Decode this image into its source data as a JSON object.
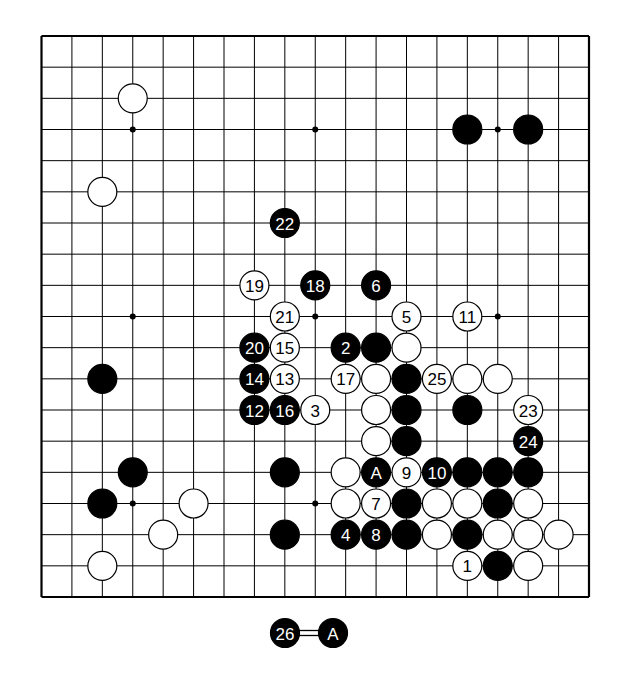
{
  "diagram": {
    "type": "go-board",
    "size": 19,
    "board_colors": {
      "line": "#000000",
      "background": "#ffffff",
      "black_stone": "#000000",
      "white_stone": "#ffffff",
      "black_text": "#ffffff",
      "white_text": "#000000"
    },
    "star_points": [
      [
        3,
        3
      ],
      [
        9,
        3
      ],
      [
        15,
        3
      ],
      [
        3,
        9
      ],
      [
        9,
        9
      ],
      [
        15,
        9
      ],
      [
        3,
        15
      ],
      [
        9,
        15
      ],
      [
        15,
        15
      ]
    ],
    "stones": [
      {
        "col": 3,
        "row": 2,
        "color": "white",
        "label": ""
      },
      {
        "col": 14,
        "row": 3,
        "color": "black",
        "label": ""
      },
      {
        "col": 16,
        "row": 3,
        "color": "black",
        "label": ""
      },
      {
        "col": 2,
        "row": 5,
        "color": "white",
        "label": ""
      },
      {
        "col": 8,
        "row": 6,
        "color": "black",
        "label": "22"
      },
      {
        "col": 7,
        "row": 8,
        "color": "white",
        "label": "19"
      },
      {
        "col": 9,
        "row": 8,
        "color": "black",
        "label": "18"
      },
      {
        "col": 11,
        "row": 8,
        "color": "black",
        "label": "6"
      },
      {
        "col": 8,
        "row": 9,
        "color": "white",
        "label": "21"
      },
      {
        "col": 12,
        "row": 9,
        "color": "white",
        "label": "5"
      },
      {
        "col": 14,
        "row": 9,
        "color": "white",
        "label": "11"
      },
      {
        "col": 7,
        "row": 10,
        "color": "black",
        "label": "20"
      },
      {
        "col": 8,
        "row": 10,
        "color": "white",
        "label": "15"
      },
      {
        "col": 10,
        "row": 10,
        "color": "black",
        "label": "2"
      },
      {
        "col": 11,
        "row": 10,
        "color": "black",
        "label": ""
      },
      {
        "col": 12,
        "row": 10,
        "color": "white",
        "label": ""
      },
      {
        "col": 2,
        "row": 11,
        "color": "black",
        "label": ""
      },
      {
        "col": 7,
        "row": 11,
        "color": "black",
        "label": "14"
      },
      {
        "col": 8,
        "row": 11,
        "color": "white",
        "label": "13"
      },
      {
        "col": 10,
        "row": 11,
        "color": "white",
        "label": "17"
      },
      {
        "col": 11,
        "row": 11,
        "color": "white",
        "label": ""
      },
      {
        "col": 12,
        "row": 11,
        "color": "black",
        "label": ""
      },
      {
        "col": 13,
        "row": 11,
        "color": "white",
        "label": "25"
      },
      {
        "col": 14,
        "row": 11,
        "color": "white",
        "label": ""
      },
      {
        "col": 15,
        "row": 11,
        "color": "white",
        "label": ""
      },
      {
        "col": 7,
        "row": 12,
        "color": "black",
        "label": "12"
      },
      {
        "col": 8,
        "row": 12,
        "color": "black",
        "label": "16"
      },
      {
        "col": 9,
        "row": 12,
        "color": "white",
        "label": "3"
      },
      {
        "col": 11,
        "row": 12,
        "color": "white",
        "label": ""
      },
      {
        "col": 12,
        "row": 12,
        "color": "black",
        "label": ""
      },
      {
        "col": 14,
        "row": 12,
        "color": "black",
        "label": ""
      },
      {
        "col": 16,
        "row": 12,
        "color": "white",
        "label": "23"
      },
      {
        "col": 11,
        "row": 13,
        "color": "white",
        "label": ""
      },
      {
        "col": 12,
        "row": 13,
        "color": "black",
        "label": ""
      },
      {
        "col": 16,
        "row": 13,
        "color": "black",
        "label": "24"
      },
      {
        "col": 3,
        "row": 14,
        "color": "black",
        "label": ""
      },
      {
        "col": 8,
        "row": 14,
        "color": "black",
        "label": ""
      },
      {
        "col": 10,
        "row": 14,
        "color": "white",
        "label": ""
      },
      {
        "col": 11,
        "row": 14,
        "color": "black",
        "label": "A"
      },
      {
        "col": 12,
        "row": 14,
        "color": "white",
        "label": "9"
      },
      {
        "col": 13,
        "row": 14,
        "color": "black",
        "label": "10"
      },
      {
        "col": 14,
        "row": 14,
        "color": "black",
        "label": ""
      },
      {
        "col": 15,
        "row": 14,
        "color": "black",
        "label": ""
      },
      {
        "col": 16,
        "row": 14,
        "color": "black",
        "label": ""
      },
      {
        "col": 2,
        "row": 15,
        "color": "black",
        "label": ""
      },
      {
        "col": 5,
        "row": 15,
        "color": "white",
        "label": ""
      },
      {
        "col": 10,
        "row": 15,
        "color": "white",
        "label": ""
      },
      {
        "col": 11,
        "row": 15,
        "color": "white",
        "label": "7"
      },
      {
        "col": 12,
        "row": 15,
        "color": "black",
        "label": ""
      },
      {
        "col": 13,
        "row": 15,
        "color": "white",
        "label": ""
      },
      {
        "col": 14,
        "row": 15,
        "color": "white",
        "label": ""
      },
      {
        "col": 15,
        "row": 15,
        "color": "black",
        "label": ""
      },
      {
        "col": 16,
        "row": 15,
        "color": "white",
        "label": ""
      },
      {
        "col": 4,
        "row": 16,
        "color": "white",
        "label": ""
      },
      {
        "col": 8,
        "row": 16,
        "color": "black",
        "label": ""
      },
      {
        "col": 10,
        "row": 16,
        "color": "black",
        "label": "4"
      },
      {
        "col": 11,
        "row": 16,
        "color": "black",
        "label": "8"
      },
      {
        "col": 12,
        "row": 16,
        "color": "black",
        "label": ""
      },
      {
        "col": 13,
        "row": 16,
        "color": "white",
        "label": ""
      },
      {
        "col": 14,
        "row": 16,
        "color": "black",
        "label": ""
      },
      {
        "col": 15,
        "row": 16,
        "color": "white",
        "label": ""
      },
      {
        "col": 16,
        "row": 16,
        "color": "white",
        "label": ""
      },
      {
        "col": 17,
        "row": 16,
        "color": "white",
        "label": ""
      },
      {
        "col": 2,
        "row": 17,
        "color": "white",
        "label": ""
      },
      {
        "col": 14,
        "row": 17,
        "color": "white",
        "label": "1"
      },
      {
        "col": 15,
        "row": 17,
        "color": "black",
        "label": ""
      },
      {
        "col": 16,
        "row": 17,
        "color": "white",
        "label": ""
      }
    ],
    "caption": {
      "left_stone": {
        "color": "black",
        "label": "26"
      },
      "connector": "=",
      "right_stone": {
        "color": "black",
        "label": "A"
      }
    }
  }
}
